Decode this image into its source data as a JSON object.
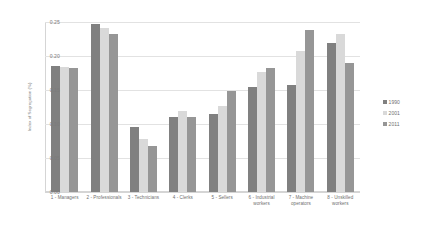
{
  "chart_data": {
    "type": "bar",
    "title": "",
    "subtitle": "",
    "xlabel": "",
    "ylabel": "Index of Segregation (%)",
    "ylim": [
      0.0,
      0.25
    ],
    "yticks": [
      "0.00",
      "0.05",
      "0.10",
      "0.15",
      "0.20",
      "0.25"
    ],
    "ytick_values": [
      0.0,
      0.05,
      0.1,
      0.15,
      0.2,
      0.25
    ],
    "grid": true,
    "legend_position": "right",
    "categories": [
      "1 - Managers",
      "2 - Professionals",
      "3 - Technicians",
      "4 - Clerks",
      "5 - Sellers",
      "6 - Industrial workers",
      "7 - Machine operators",
      "8 - Unskilled workers"
    ],
    "series": [
      {
        "name": "1990",
        "color": "#808080",
        "values": [
          0.185,
          0.247,
          0.095,
          0.11,
          0.115,
          0.154,
          0.157,
          0.219
        ]
      },
      {
        "name": "2001",
        "color": "#d9d9d9",
        "values": [
          0.184,
          0.241,
          0.078,
          0.119,
          0.127,
          0.176,
          0.208,
          0.233
        ]
      },
      {
        "name": "2011",
        "color": "#969696",
        "values": [
          0.182,
          0.233,
          0.067,
          0.11,
          0.148,
          0.182,
          0.238,
          0.19
        ]
      }
    ]
  },
  "legend": {
    "items": [
      {
        "label": "1990",
        "color": "#808080"
      },
      {
        "label": "2001",
        "color": "#d9d9d9"
      },
      {
        "label": "2011",
        "color": "#969696"
      }
    ]
  },
  "colors": {
    "gridline": "#e2e2e2",
    "axis": "#d5d5d5",
    "tick_text": "#7b7b7b",
    "label_text": "#6f6f6f",
    "background": "#ffffff"
  }
}
